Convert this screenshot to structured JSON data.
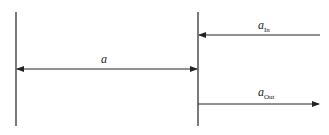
{
  "diagram": {
    "lines": {
      "left_boundary": {
        "x": 16,
        "y1": 12,
        "y2": 126
      },
      "right_boundary": {
        "x": 198,
        "y1": 12,
        "y2": 126
      }
    },
    "arrows": [
      {
        "id": "a",
        "label": "a",
        "subscript": "",
        "from": [
          16,
          69
        ],
        "to": [
          198,
          69
        ],
        "heads": "both"
      },
      {
        "id": "a_in",
        "label": "a",
        "subscript": "In",
        "from": [
          320,
          35
        ],
        "to": [
          198,
          35
        ],
        "heads": "end"
      },
      {
        "id": "a_out",
        "label": "a",
        "subscript": "Out",
        "from": [
          198,
          104
        ],
        "to": [
          320,
          104
        ],
        "heads": "end"
      }
    ],
    "labels": {
      "a": {
        "main": "a"
      },
      "a_in": {
        "main": "a",
        "sub": "In"
      },
      "a_out": {
        "main": "a",
        "sub": "Out"
      }
    },
    "colors": {
      "stroke": "#222222",
      "background": "#ffffff"
    }
  }
}
